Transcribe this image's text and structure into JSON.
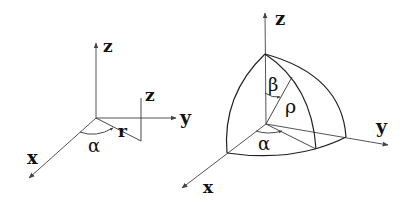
{
  "left_figure": {
    "labels": {
      "z_axis": "z",
      "y_axis": "y",
      "x_axis": "x",
      "z_height": "z",
      "radius": "r",
      "angle": "α"
    }
  },
  "right_figure": {
    "labels": {
      "z_axis": "z",
      "y_axis": "y",
      "x_axis": "x",
      "polar_angle": "β",
      "radius": "ρ",
      "azimuth": "α"
    }
  },
  "colors": {
    "line": "#222222",
    "background": "#ffffff"
  }
}
